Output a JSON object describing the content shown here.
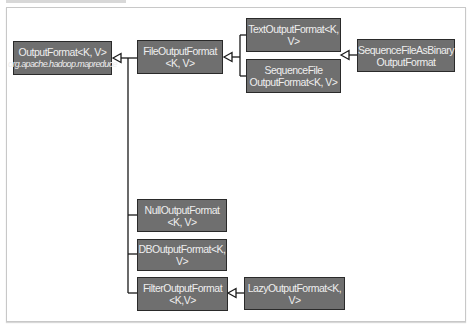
{
  "diagram": {
    "nodes": [
      {
        "id": "outputformat",
        "line1": "OutputFormat<K, V>",
        "line2": "org.apache.hadoop.mapreduce"
      },
      {
        "id": "fileoutputformat",
        "line1": "FileOutputFormat",
        "line2": "<K, V>"
      },
      {
        "id": "textoutputformat",
        "line1": "TextOutputFormat<K, V>",
        "line2": ""
      },
      {
        "id": "sequencefileoutputformat",
        "line1": "SequenceFile",
        "line2": "OutputFormat<K, V>"
      },
      {
        "id": "sequencefileasbinaryoutputformat",
        "line1": "SequenceFileAsBinary",
        "line2": "OutputFormat"
      },
      {
        "id": "nulloutputformat",
        "line1": "NullOutputFormat",
        "line2": "<K, V>"
      },
      {
        "id": "dboutputformat",
        "line1": "DBOutputFormat<K, V>",
        "line2": ""
      },
      {
        "id": "filteroutputformat",
        "line1": "FilterOutputFormat",
        "line2": "<K,V>"
      },
      {
        "id": "lazyoutputformat",
        "line1": "LazyOutputFormat<K, V>",
        "line2": ""
      }
    ],
    "edges": [
      {
        "from": "fileoutputformat",
        "to": "outputformat",
        "type": "inherits"
      },
      {
        "from": "nulloutputformat",
        "to": "outputformat",
        "type": "inherits"
      },
      {
        "from": "dboutputformat",
        "to": "outputformat",
        "type": "inherits"
      },
      {
        "from": "filteroutputformat",
        "to": "outputformat",
        "type": "inherits"
      },
      {
        "from": "textoutputformat",
        "to": "fileoutputformat",
        "type": "inherits"
      },
      {
        "from": "sequencefileoutputformat",
        "to": "fileoutputformat",
        "type": "inherits"
      },
      {
        "from": "sequencefileasbinaryoutputformat",
        "to": "sequencefileoutputformat",
        "type": "inherits"
      },
      {
        "from": "lazyoutputformat",
        "to": "filteroutputformat",
        "type": "inherits"
      }
    ],
    "colors": {
      "box_fill": "#6f6f6f",
      "box_border": "#2a2a2a",
      "box_text": "#eeeeee",
      "line": "#1a1a1a"
    }
  }
}
